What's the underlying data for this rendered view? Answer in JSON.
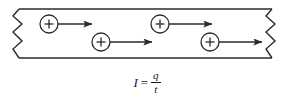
{
  "figure": {
    "colors": {
      "stroke": "#2b2b2b",
      "fill": "#ffffff",
      "text": "#1a1a1a"
    }
  },
  "conductor": {
    "label": "conductor-wire",
    "top_y": 9,
    "bottom_y": 58,
    "left_break_x": 19,
    "right_break_x": 272,
    "break_style": "zigzag"
  },
  "charges": [
    {
      "id": 1,
      "sign": "+",
      "cx": 49,
      "cy": 24,
      "r": 9,
      "arrow_from_x": 58,
      "arrow_to_x": 92,
      "arrow_y": 24
    },
    {
      "id": 2,
      "sign": "+",
      "cx": 101,
      "cy": 42,
      "r": 9,
      "arrow_from_x": 110,
      "arrow_to_x": 152,
      "arrow_y": 42
    },
    {
      "id": 3,
      "sign": "+",
      "cx": 160,
      "cy": 24,
      "r": 9,
      "arrow_from_x": 169,
      "arrow_to_x": 212,
      "arrow_y": 24
    },
    {
      "id": 4,
      "sign": "+",
      "cx": 210,
      "cy": 42,
      "r": 9,
      "arrow_from_x": 219,
      "arrow_to_x": 262,
      "arrow_y": 42
    }
  ],
  "equation": {
    "lhs": "I",
    "operator": "=",
    "numerator": "q",
    "denominator": "t",
    "plain": "I = q / t"
  }
}
